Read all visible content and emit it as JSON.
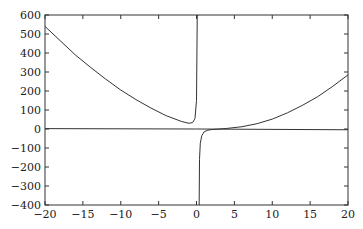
{
  "chart_data": {
    "type": "line",
    "title": "",
    "xlabel": "",
    "ylabel": "",
    "xlim": [
      -20,
      20
    ],
    "ylim": [
      -400,
      600
    ],
    "grid": false,
    "legend": null,
    "x_ticks": [
      -20,
      -15,
      -10,
      -5,
      0,
      5,
      10,
      15,
      20
    ],
    "x_tick_labels": [
      "−20",
      "−15",
      "−10",
      "−5",
      "0",
      "5",
      "10",
      "15",
      "20"
    ],
    "y_ticks": [
      -400,
      -300,
      -200,
      -100,
      0,
      100,
      200,
      300,
      400,
      500,
      600
    ],
    "y_tick_labels": [
      "−400",
      "−300",
      "−200",
      "−100",
      "0",
      "100",
      "200",
      "300",
      "400",
      "500",
      "600"
    ],
    "series": [
      {
        "name": "curve with vertical asymptote",
        "color": "#333333",
        "asymptote_x": 0.3,
        "x": [
          -20,
          -18,
          -16,
          -14,
          -12,
          -10,
          -8,
          -6,
          -4,
          -2,
          -1,
          -0.5,
          -0.2,
          0,
          0.1,
          0.2,
          0.25,
          0.28,
          0.32,
          0.35,
          0.4,
          0.5,
          0.7,
          1,
          1.5,
          2,
          3,
          4,
          6,
          8,
          10,
          12,
          14,
          16,
          18,
          20
        ],
        "y": [
          540,
          465,
          390,
          325,
          263,
          205,
          155,
          110,
          70,
          40,
          30,
          34,
          55,
          150,
          600,
          600,
          600,
          600,
          -400,
          -400,
          -160,
          -75,
          -35,
          -15,
          -6,
          -3,
          0,
          3,
          12,
          28,
          52,
          85,
          125,
          170,
          225,
          285
        ]
      },
      {
        "name": "near-zero line",
        "color": "#333333",
        "x": [
          -20,
          0,
          20
        ],
        "y": [
          2,
          0,
          -4
        ]
      }
    ]
  }
}
